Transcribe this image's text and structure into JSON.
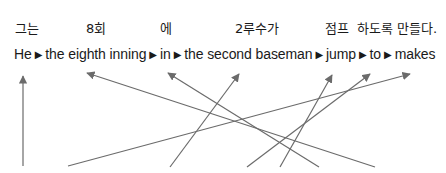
{
  "korean_words": [
    {
      "text": "그는",
      "x": 15
    },
    {
      "text": "8회",
      "x": 86
    },
    {
      "text": "에",
      "x": 160
    },
    {
      "text": "2루수가",
      "x": 235
    },
    {
      "text": "점프",
      "x": 325
    },
    {
      "text": "하도록",
      "x": 357
    },
    {
      "text": "만들다.",
      "x": 397
    }
  ],
  "english_words": [
    "He",
    "the eighth inning",
    "in",
    "the second baseman",
    "jump",
    "to",
    "makes"
  ],
  "separator": "▶",
  "arrow_color": "#6b6b6b",
  "arrows": [
    {
      "from": [
        23,
        166
      ],
      "to": [
        23,
        76
      ]
    },
    {
      "from": [
        375,
        167
      ],
      "to": [
        87,
        73
      ]
    },
    {
      "from": [
        319,
        167
      ],
      "to": [
        168,
        73
      ]
    },
    {
      "from": [
        170,
        167
      ],
      "to": [
        239,
        74
      ]
    },
    {
      "from": [
        247,
        167
      ],
      "to": [
        370,
        74
      ]
    },
    {
      "from": [
        280,
        167
      ],
      "to": [
        332,
        75
      ]
    },
    {
      "from": [
        68,
        166
      ],
      "to": [
        410,
        74
      ]
    }
  ]
}
